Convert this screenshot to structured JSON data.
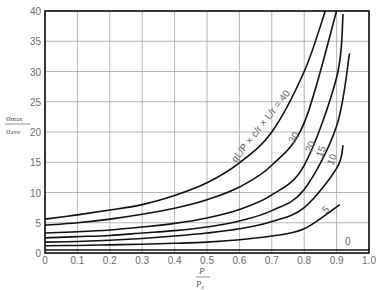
{
  "chart_data": {
    "type": "line",
    "title": "",
    "xlabel": {
      "num": "P",
      "den": "P_e"
    },
    "ylabel": {
      "num": "σ_max",
      "den": "σ_ave"
    },
    "xlim": [
      0,
      1.0
    ],
    "ylim": [
      0,
      40
    ],
    "grid": true,
    "x_ticks": [
      "0",
      "0.1",
      "0.2",
      "0.3",
      "0.4",
      "0.5",
      "0.6",
      "0.7",
      "0.8",
      "0.9",
      "1.0"
    ],
    "y_ticks": [
      "0",
      "5",
      "10",
      "15",
      "20",
      "25",
      "30",
      "35",
      "40"
    ],
    "curve_label_formula": "qL/P × c/r × L/r = 40",
    "series": [
      {
        "name": "40",
        "label": "qL/P × c/r × L/r = 40",
        "x": [
          0,
          0.1,
          0.2,
          0.3,
          0.4,
          0.5,
          0.6,
          0.7,
          0.8,
          0.865
        ],
        "values": [
          5.6,
          6.3,
          7.1,
          8.0,
          9.5,
          11.6,
          14.9,
          20.0,
          30.0,
          40.0
        ]
      },
      {
        "name": "30",
        "label": "30",
        "x": [
          0,
          0.1,
          0.2,
          0.3,
          0.4,
          0.5,
          0.6,
          0.7,
          0.8,
          0.9
        ],
        "values": [
          4.6,
          5.0,
          5.6,
          6.4,
          7.4,
          8.8,
          10.9,
          14.5,
          21.5,
          40.0
        ]
      },
      {
        "name": "20",
        "label": "20",
        "x": [
          0,
          0.1,
          0.2,
          0.3,
          0.4,
          0.5,
          0.6,
          0.7,
          0.8,
          0.9,
          0.92
        ],
        "values": [
          3.3,
          3.5,
          3.8,
          4.3,
          4.9,
          5.8,
          7.2,
          9.6,
          14.5,
          29.0,
          39.5
        ]
      },
      {
        "name": "15",
        "label": "15",
        "x": [
          0,
          0.1,
          0.2,
          0.3,
          0.4,
          0.5,
          0.6,
          0.7,
          0.8,
          0.9,
          0.94
        ],
        "values": [
          2.5,
          2.7,
          2.9,
          3.3,
          3.7,
          4.3,
          5.3,
          7.0,
          10.5,
          21.0,
          33.0
        ]
      },
      {
        "name": "10",
        "label": "10",
        "x": [
          0,
          0.1,
          0.2,
          0.3,
          0.4,
          0.5,
          0.6,
          0.7,
          0.8,
          0.9,
          0.92
        ],
        "values": [
          1.8,
          1.9,
          2.1,
          2.4,
          2.8,
          3.3,
          4.0,
          5.2,
          7.5,
          14.0,
          17.8
        ]
      },
      {
        "name": "5",
        "label": "5",
        "x": [
          0,
          0.1,
          0.2,
          0.3,
          0.4,
          0.5,
          0.6,
          0.7,
          0.8,
          0.91
        ],
        "values": [
          1.2,
          1.25,
          1.35,
          1.45,
          1.6,
          1.8,
          2.2,
          2.8,
          4.0,
          8.0
        ]
      },
      {
        "name": "0",
        "label": "0",
        "x": [
          0,
          1.0
        ],
        "values": [
          0.5,
          0.5
        ]
      }
    ]
  }
}
